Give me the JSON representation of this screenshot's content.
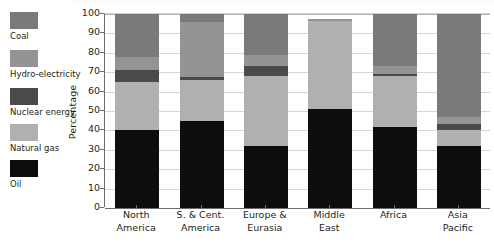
{
  "chart_data": {
    "type": "bar",
    "stacked": true,
    "orientation": "vertical",
    "title": "",
    "subtitle": "",
    "xlabel": "",
    "ylabel": "Percentage",
    "ylim": [
      0,
      100
    ],
    "ytick_step": 10,
    "yticks": [
      100,
      90,
      80,
      70,
      60,
      50,
      40,
      30,
      20,
      10,
      0
    ],
    "grid": true,
    "legend_position": "left",
    "legend_order": [
      "Coal",
      "Hydro-electricity",
      "Nuclear energy",
      "Natural gas",
      "Oil"
    ],
    "stack_order_bottom_to_top": [
      "Oil",
      "Natural gas",
      "Nuclear energy",
      "Hydro-electricity",
      "Coal"
    ],
    "categories": [
      "North America",
      "S. & Cent. America",
      "Europe & Eurasia",
      "Middle East",
      "Africa",
      "Asia Pacific"
    ],
    "category_lines": [
      [
        "North",
        "America"
      ],
      [
        "S. & Cent.",
        "America"
      ],
      [
        "Europe &",
        "Eurasia"
      ],
      [
        "Middle",
        "East"
      ],
      [
        "Africa",
        ""
      ],
      [
        "Asia",
        "Pacific"
      ]
    ],
    "series": [
      {
        "name": "Oil",
        "color": "#0d0d0d",
        "values": [
          40.0,
          45.0,
          32.0,
          51.0,
          42.0,
          32.0
        ]
      },
      {
        "name": "Natural gas",
        "color": "#b0b0b0",
        "values": [
          25.0,
          21.0,
          36.0,
          45.5,
          26.0,
          8.0
        ]
      },
      {
        "name": "Nuclear energy",
        "color": "#4a4a4a",
        "values": [
          6.0,
          1.5,
          5.0,
          0.0,
          1.0,
          3.5
        ]
      },
      {
        "name": "Hydro-electricity",
        "color": "#949494",
        "values": [
          7.0,
          28.5,
          6.0,
          1.0,
          4.0,
          3.5
        ]
      },
      {
        "name": "Coal",
        "color": "#7a7a7a",
        "values": [
          22.0,
          4.0,
          21.0,
          0.0,
          27.0,
          53.0
        ]
      }
    ],
    "stack_boundaries": {
      "North America": [
        0,
        40,
        65,
        71,
        78,
        100
      ],
      "S. & Cent. America": [
        0,
        45,
        66,
        67.5,
        96,
        100
      ],
      "Europe & Eurasia": [
        0,
        32,
        68,
        73,
        79,
        100
      ],
      "Middle East": [
        0,
        51,
        96.5,
        96.5,
        97.5,
        97.5
      ],
      "Africa": [
        0,
        42,
        68,
        69,
        73,
        100
      ],
      "Asia Pacific": [
        0,
        32,
        40,
        43.5,
        47,
        100
      ]
    }
  },
  "legend": {
    "items": [
      {
        "label": "Coal",
        "color": "#7a7a7a"
      },
      {
        "label": "Hydro-electricity",
        "color": "#949494"
      },
      {
        "label": "Nuclear energy",
        "color": "#4a4a4a"
      },
      {
        "label": "Natural gas",
        "color": "#b0b0b0"
      },
      {
        "label": "Oil",
        "color": "#0d0d0d"
      }
    ]
  },
  "axes": {
    "ylabel": "Percentage",
    "ytick_labels": [
      "100",
      "90",
      "80",
      "70",
      "60",
      "50",
      "40",
      "30",
      "20",
      "10",
      "0"
    ]
  }
}
